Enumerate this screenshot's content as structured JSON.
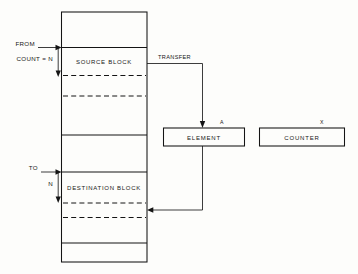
{
  "diagram": {
    "memory_column": {
      "name": "memory-column",
      "segments": [
        {
          "label": "",
          "kind": "empty"
        },
        {
          "label": "SOURCE  BLOCK",
          "kind": "named"
        },
        {
          "label": "",
          "kind": "empty"
        },
        {
          "label": "",
          "kind": "empty"
        },
        {
          "label": "",
          "kind": "empty"
        },
        {
          "label": "DESTINATION BLOCK",
          "kind": "named"
        },
        {
          "label": "",
          "kind": "empty"
        },
        {
          "label": "",
          "kind": "empty"
        }
      ]
    },
    "pointers": [
      {
        "id": "from",
        "label": "FROM",
        "direction": "right"
      },
      {
        "id": "count",
        "label": "COUNT = N",
        "direction": "down"
      },
      {
        "id": "to",
        "label": "TO",
        "direction": "right"
      },
      {
        "id": "n",
        "label": "N",
        "direction": "down"
      }
    ],
    "flow": {
      "transfer_label": "TRANSFER"
    },
    "boxes": [
      {
        "id": "element",
        "label": "ELEMENT",
        "tag": "A"
      },
      {
        "id": "counter",
        "label": "COUNTER",
        "tag": "X"
      }
    ],
    "colors": {
      "ink": "#141414",
      "paper": "#fdfdfb"
    }
  }
}
